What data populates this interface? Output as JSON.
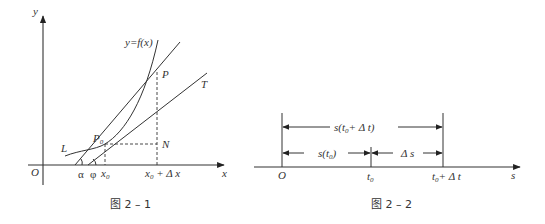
{
  "figure1": {
    "caption": "图 2 – 1",
    "axis_x_label": "x",
    "axis_y_label": "y",
    "origin_label": "O",
    "curve_label": "y=f(x)",
    "curve_name": "L",
    "point_p0": "P",
    "point_p0_sub": "0",
    "point_p": "P",
    "point_n": "N",
    "tangent_label": "T",
    "angle_alpha": "α",
    "angle_phi": "φ",
    "tick_x0": "x",
    "tick_x0_sub": "0",
    "tick_x0dx_a": "x",
    "tick_x0dx_sub": "0",
    "tick_x0dx_b": " + Δ x"
  },
  "figure2": {
    "caption": "图 2 – 2",
    "axis_label": "s",
    "origin_label": "O",
    "tick_t0": "t",
    "tick_t0_sub": "0",
    "tick_t0dt_a": "t",
    "tick_t0dt_sub": "0",
    "tick_t0dt_b": "+ Δ t",
    "span_total_a": "s(t",
    "span_total_sub": "0",
    "span_total_b": "+ Δ t)",
    "span_first_a": "s(t",
    "span_first_sub": "0",
    "span_first_b": ")",
    "span_delta": "Δ s"
  }
}
